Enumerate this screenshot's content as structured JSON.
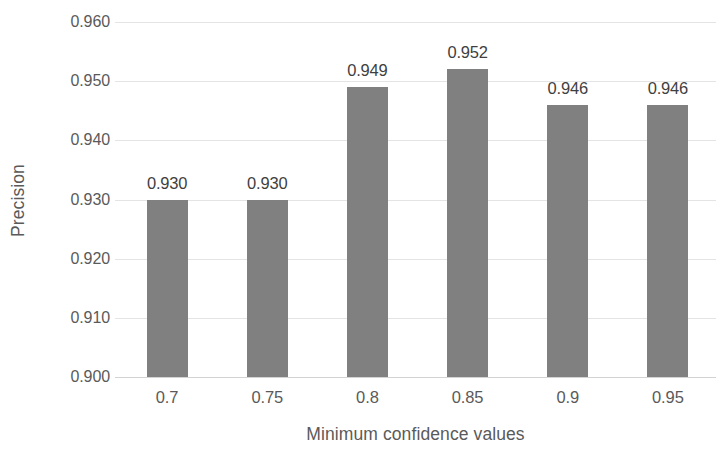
{
  "chart_data": {
    "type": "bar",
    "title": "",
    "subtitle": "",
    "xlabel": "Minimum confidence values",
    "ylabel": "Precision",
    "categories": [
      "0.7",
      "0.75",
      "0.8",
      "0.85",
      "0.9",
      "0.95"
    ],
    "values": [
      0.93,
      0.93,
      0.949,
      0.952,
      0.946,
      0.946
    ],
    "value_labels": [
      "0.930",
      "0.930",
      "0.949",
      "0.952",
      "0.946",
      "0.946"
    ],
    "ylim": [
      0.9,
      0.96
    ],
    "ytick_values": [
      0.9,
      0.91,
      0.92,
      0.93,
      0.94,
      0.95,
      0.96
    ],
    "ytick_labels": [
      "0.900",
      "0.910",
      "0.920",
      "0.930",
      "0.940",
      "0.950",
      "0.960"
    ],
    "grid": "horizontal",
    "legend": "none",
    "bar_color": "#808080",
    "gridline_color": "#e4e4e4",
    "axis_line_color": "#d3d3d3",
    "label_color": "#5a5a5a",
    "background_color": "#ffffff"
  }
}
